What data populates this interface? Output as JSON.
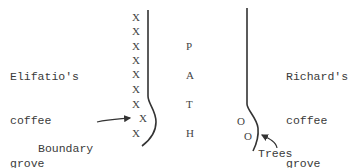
{
  "left_grove": {
    "lines": [
      "Elifatio's",
      "coffee",
      "grove"
    ]
  },
  "right_grove": {
    "lines": [
      "Richard's",
      "coffee",
      "grove"
    ]
  },
  "path_label": [
    "P",
    "A",
    "T",
    "H"
  ],
  "boundary_label": {
    "lines": [
      "Boundary",
      "plants"
    ]
  },
  "trees_label": "Trees",
  "boundary_marker": "X",
  "tree_marker": "O",
  "x_markers": [
    {
      "x": 132,
      "y": 12
    },
    {
      "x": 132,
      "y": 26
    },
    {
      "x": 132,
      "y": 41
    },
    {
      "x": 132,
      "y": 55
    },
    {
      "x": 132,
      "y": 69
    },
    {
      "x": 132,
      "y": 84
    },
    {
      "x": 132,
      "y": 99
    },
    {
      "x": 139,
      "y": 113
    },
    {
      "x": 132,
      "y": 128
    }
  ],
  "o_markers": [
    {
      "x": 237,
      "y": 116
    },
    {
      "x": 244,
      "y": 131
    }
  ]
}
